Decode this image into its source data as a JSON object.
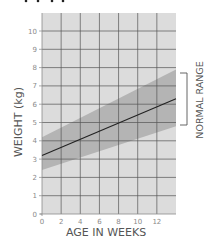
{
  "chart_data": {
    "type": "line",
    "title": "",
    "xlabel": "AGE IN WEEKS",
    "ylabel": "WEIGHT (kg)",
    "x_ticks": [
      "0",
      "2",
      "4",
      "6",
      "8",
      "10",
      "12"
    ],
    "y_ticks": [
      "0",
      "1",
      "2",
      "3",
      "4",
      "5",
      "6",
      "7",
      "8",
      "9",
      "10"
    ],
    "xlim": [
      0,
      14
    ],
    "ylim": [
      0,
      11
    ],
    "grid": true,
    "series": [
      {
        "name": "Average weight",
        "x": [
          0,
          14
        ],
        "values": [
          3.2,
          6.3
        ],
        "color": "#222222"
      }
    ],
    "band": {
      "name": "Normal range",
      "x": [
        0,
        14
      ],
      "upper": [
        4.2,
        7.9
      ],
      "lower": [
        2.4,
        4.8
      ],
      "color": "#b3b3b3"
    },
    "annotations": [
      {
        "text": "NORMAL RANGE",
        "type": "bracket",
        "y_from": 4.4,
        "y_to": 7.7,
        "position": "right"
      }
    ]
  },
  "colors": {
    "plot_bg": "#dcdcdc",
    "band": "#b4b4b4",
    "grid": "#555555",
    "line": "#222222",
    "text": "#555555",
    "tick_text": "#8a8a8a"
  }
}
